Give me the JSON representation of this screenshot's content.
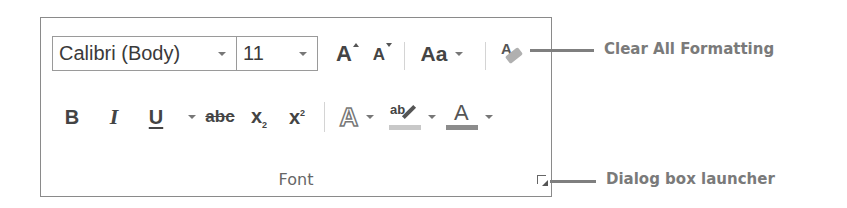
{
  "ribbon_group": {
    "label": "Font",
    "font_name": {
      "value": "Calibri (Body)"
    },
    "font_size": {
      "value": "11"
    },
    "row1": {
      "grow_font": {
        "glyph": "A",
        "icon": "grow-font-icon"
      },
      "shrink_font": {
        "glyph": "A",
        "icon": "shrink-font-icon"
      },
      "change_case": {
        "glyph": "Aa",
        "icon": "change-case-icon"
      },
      "clear_formatting": {
        "glyph": "A",
        "icon": "eraser-icon"
      }
    },
    "row2": {
      "bold": {
        "glyph": "B"
      },
      "italic": {
        "glyph": "I"
      },
      "underline": {
        "glyph": "U"
      },
      "strikethrough": {
        "glyph": "abc"
      },
      "subscript": {
        "glyph": "x",
        "sub": "2"
      },
      "superscript": {
        "glyph": "x",
        "sup": "2"
      },
      "text_effects": {
        "glyph": "A"
      },
      "highlight": {
        "glyph": "ab",
        "color": "#c8c8c8"
      },
      "font_color": {
        "glyph": "A",
        "color": "#8c8c8c"
      }
    },
    "dialog_launcher": {
      "icon": "dialog-launcher-icon"
    }
  },
  "callouts": [
    {
      "label": "Clear All Formatting"
    },
    {
      "label": "Dialog box launcher"
    }
  ]
}
